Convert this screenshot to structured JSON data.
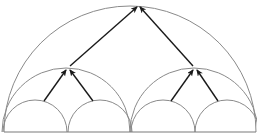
{
  "diagram": {
    "type": "nested-semicircle-binary-tree",
    "colors": {
      "arc": "#8a8a8a",
      "arrow": "#1a1a1a",
      "baseline": "#7a7a7a",
      "background": "#ffffff"
    },
    "baseline": {
      "x1": 4,
      "x2": 256,
      "y": 132
    },
    "levels": [
      {
        "name": "root",
        "arcs": [
          {
            "cx": 130,
            "r": 126
          }
        ]
      },
      {
        "name": "middle",
        "arcs": [
          {
            "cx": 66,
            "r": 64
          },
          {
            "cx": 194,
            "r": 64
          }
        ]
      },
      {
        "name": "leaf",
        "arcs": [
          {
            "cx": 35,
            "r": 32
          },
          {
            "cx": 100,
            "r": 32
          },
          {
            "cx": 163,
            "r": 32
          },
          {
            "cx": 227,
            "r": 32
          }
        ]
      }
    ],
    "arrows": [
      {
        "from": [
          70,
          66
        ],
        "to": [
          137,
          7
        ]
      },
      {
        "from": [
          193,
          66
        ],
        "to": [
          140,
          7
        ]
      },
      {
        "from": [
          44,
          101
        ],
        "to": [
          66,
          70
        ]
      },
      {
        "from": [
          93,
          101
        ],
        "to": [
          70,
          70
        ]
      },
      {
        "from": [
          171,
          101
        ],
        "to": [
          193,
          70
        ]
      },
      {
        "from": [
          218,
          101
        ],
        "to": [
          197,
          70
        ]
      }
    ]
  }
}
